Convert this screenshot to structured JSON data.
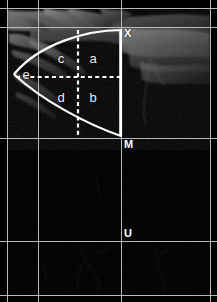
{
  "figure": {
    "title": "Annotated sagittal scan with sector measurement overlay",
    "width": 217,
    "height": 302,
    "background_color": "#000000",
    "grid_color": "#b9b9b9",
    "overlay_color": "#ffffff",
    "label_color": "#f2f2f2"
  },
  "zones": [
    {
      "id": "a",
      "label": "a",
      "x": 93,
      "y": 58,
      "description": "upper-right quadrant of sector"
    },
    {
      "id": "b",
      "label": "b",
      "x": 93,
      "y": 97,
      "description": "lower-right quadrant of sector"
    },
    {
      "id": "c",
      "label": "c",
      "x": 61,
      "y": 58,
      "description": "upper-left quadrant of sector"
    },
    {
      "id": "d",
      "label": "d",
      "x": 61,
      "y": 97,
      "description": "lower-left quadrant of sector"
    },
    {
      "id": "e",
      "label": "e",
      "x": 26,
      "y": 74,
      "description": "apex region of sector"
    }
  ],
  "landmarks": [
    {
      "id": "X",
      "label": "X",
      "x": 124,
      "y": 33,
      "description": "upper landmark at top of vertical caliper"
    },
    {
      "id": "M",
      "label": "M",
      "x": 124,
      "y": 144,
      "description": "middle landmark on horizontal gridline"
    },
    {
      "id": "U",
      "label": "U",
      "x": 124,
      "y": 233,
      "description": "lower landmark"
    }
  ],
  "gridlines": {
    "horizontal": [
      8,
      27,
      138,
      241,
      295
    ],
    "vertical": [
      7,
      38,
      121,
      210
    ]
  },
  "overlay": {
    "sector_outline": {
      "apex_x": 14,
      "apex_y": 74,
      "right_x": 121,
      "top_y": 30,
      "bottom_y": 136
    },
    "dashed_horizontal": {
      "x1": 16,
      "x2": 121,
      "y": 77
    },
    "dashed_vertical": {
      "x": 78,
      "y1": 30,
      "y2": 138
    }
  }
}
